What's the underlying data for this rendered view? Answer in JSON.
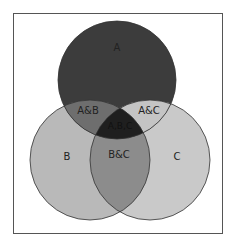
{
  "diagram": {
    "type": "venn",
    "sets": [
      {
        "id": "A",
        "label": "A",
        "fill": "#3c3c3c"
      },
      {
        "id": "B",
        "label": "B",
        "fill": "#b9b9b9"
      },
      {
        "id": "C",
        "label": "C",
        "fill": "#c9c9c9"
      }
    ],
    "regions": {
      "ab": {
        "label": "A&B",
        "fill": "#6e6e6e"
      },
      "ac": {
        "label": "A&C",
        "fill": "#c4c4c4"
      },
      "bc": {
        "label": "B&C",
        "fill": "#8c8c8c"
      },
      "abc": {
        "label": "A,B,C",
        "fill": "#1f1f1f"
      }
    },
    "stroke": "#333333"
  }
}
